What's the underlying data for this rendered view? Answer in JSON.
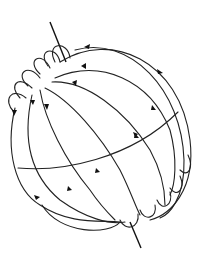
{
  "diagram": {
    "colors": {
      "line": "#222222",
      "background": "#ffffff"
    },
    "axis": {
      "x1": 50,
      "y1": 22,
      "x2": 141,
      "y2": 248
    },
    "sphere": {
      "cx": 105,
      "cy": 140,
      "rx": 83,
      "ry": 95
    },
    "labels": []
  }
}
